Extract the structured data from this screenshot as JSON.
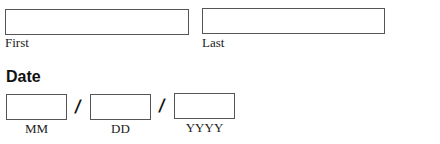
{
  "name": {
    "first": {
      "label": "First",
      "value": "",
      "placeholder": ""
    },
    "last": {
      "label": "Last",
      "value": "",
      "placeholder": ""
    }
  },
  "date": {
    "heading": "Date",
    "separator": "/",
    "month": {
      "label": "MM",
      "value": ""
    },
    "day": {
      "label": "DD",
      "value": ""
    },
    "year": {
      "label": "YYYY",
      "value": ""
    }
  }
}
